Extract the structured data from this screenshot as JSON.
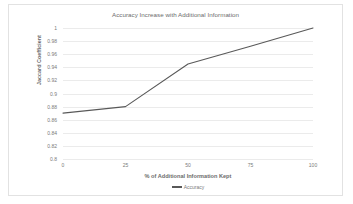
{
  "chart_data": {
    "type": "line",
    "title": "Accuracy Increase with Additional Information",
    "xlabel": "% of Additional Information Kept",
    "ylabel": "Jaccard Coefficient",
    "x": [
      0,
      25,
      50,
      75,
      100
    ],
    "series": [
      {
        "name": "Accuracy",
        "values": [
          0.87,
          0.88,
          0.945,
          0.972,
          1.0
        ],
        "color": "#595959"
      }
    ],
    "xlim": [
      0,
      100
    ],
    "ylim": [
      0.8,
      1.0
    ],
    "xticks": [
      0,
      25,
      50,
      75,
      100
    ],
    "xtick_labels": [
      "0",
      "25",
      "50",
      "75",
      "100"
    ],
    "yticks": [
      0.8,
      0.82,
      0.84,
      0.86,
      0.88,
      0.9,
      0.92,
      0.94,
      0.96,
      0.98,
      1.0
    ],
    "ytick_labels": [
      "0.8",
      "0.82",
      "0.84",
      "0.86",
      "0.88",
      "0.9",
      "0.92",
      "0.94",
      "0.96",
      "0.98",
      "1"
    ],
    "grid": "horizontal",
    "legend_position": "bottom",
    "legend_entries": [
      "Accuracy"
    ]
  },
  "colors": {
    "line": "#595959",
    "gridline": "#ebebeb",
    "text": "#7a7a7a",
    "title_text": "#6b6b6b",
    "border": "#e2e2e2",
    "background": "#ffffff"
  }
}
